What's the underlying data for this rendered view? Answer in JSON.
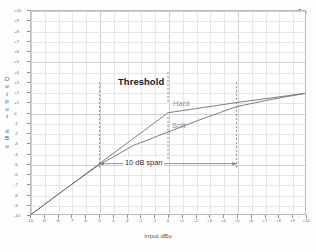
{
  "logo": {
    "text": "Ap",
    "name": "audio-precision-logo"
  },
  "axes": {
    "x_title": "Input dBu",
    "y_title_letters": [
      "O",
      "u",
      "t",
      "p",
      "u",
      "t",
      " ",
      "d",
      "B",
      "u"
    ],
    "x_ticks": [
      "-10",
      "-9",
      "-8",
      "-7",
      "-6",
      "-5",
      "-4",
      "-3",
      "-2",
      "-1",
      "0",
      "+1",
      "+2",
      "+3",
      "+4",
      "+5",
      "+6",
      "+7",
      "+8",
      "+9",
      "+10"
    ],
    "y_ticks": [
      "+10",
      "+9",
      "+8",
      "+7",
      "+6",
      "+5",
      "+4",
      "+3",
      "+2",
      "+1",
      "0",
      "-1",
      "-2",
      "-3",
      "-4",
      "-5",
      "-6",
      "-7",
      "-8",
      "-9",
      "-10"
    ]
  },
  "annotations": {
    "threshold": "Threshold",
    "hard": "Hard",
    "soft": "Soft",
    "span": "10 dB span"
  },
  "colors": {
    "curve": "#6e6e75",
    "grid_minor": "#e6e6ea",
    "grid_major": "#cfcfd6",
    "axis_text": "#6f6f76",
    "annotation": "#2b2b2e",
    "knee_label": "#8b8b92"
  },
  "chart_data": {
    "type": "line",
    "title": "",
    "xlabel": "Input dBu",
    "ylabel": "Output dBu",
    "xlim": [
      -10,
      10
    ],
    "ylim": [
      -10,
      10
    ],
    "grid": true,
    "legend": "inline-labels",
    "threshold_dbu": 0,
    "knee_span_db": 10,
    "knee_span_range": [
      -5,
      5
    ],
    "series": [
      {
        "name": "Hard",
        "x": [
          -10,
          -5,
          0,
          5,
          10
        ],
        "values": [
          -10,
          -5,
          0,
          1.0,
          1.9
        ]
      },
      {
        "name": "Soft",
        "x": [
          -10,
          -7.5,
          -5,
          -2.5,
          0,
          2.5,
          5,
          7.5,
          10
        ],
        "values": [
          -10,
          -7.5,
          -5.1,
          -3.2,
          -1.9,
          -0.6,
          0.6,
          1.3,
          1.9
        ]
      }
    ]
  }
}
